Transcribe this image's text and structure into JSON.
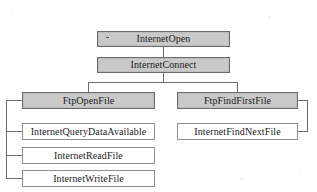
{
  "diagram": {
    "type": "flowchart",
    "colors": {
      "shaded_fill": "#c9c9c9",
      "shaded_border": "#6b6b6b",
      "plain_fill": "#ffffff",
      "plain_border": "#8f8f8f",
      "connector": "#6d6d6d",
      "text": "#1b1b1b",
      "background": "#ffffff"
    },
    "nodes": [
      {
        "id": "internet-open",
        "label": "InternetOpen",
        "style": "shaded",
        "marker": "·",
        "x": 97,
        "y": 31,
        "w": 133,
        "h": 16
      },
      {
        "id": "internet-connect",
        "label": "InternetConnect",
        "style": "shaded",
        "x": 97,
        "y": 57,
        "w": 133,
        "h": 16
      },
      {
        "id": "ftp-open-file",
        "label": "FtpOpenFile",
        "style": "shaded",
        "x": 22,
        "y": 92,
        "w": 133,
        "h": 17
      },
      {
        "id": "ftp-find-first-file",
        "label": "FtpFindFirstFile",
        "style": "shaded",
        "x": 177,
        "y": 92,
        "w": 121,
        "h": 17
      },
      {
        "id": "internet-query-data-available",
        "label": "InternetQueryDataAvailable",
        "style": "plain",
        "x": 22,
        "y": 123,
        "w": 133,
        "h": 17
      },
      {
        "id": "internet-find-next-file",
        "label": "InternetFindNextFile",
        "style": "plain",
        "x": 177,
        "y": 123,
        "w": 121,
        "h": 17
      },
      {
        "id": "internet-read-file",
        "label": "InternetReadFile",
        "style": "plain",
        "x": 22,
        "y": 147,
        "w": 133,
        "h": 17
      },
      {
        "id": "internet-write-file",
        "label": "InternetWriteFile",
        "style": "plain",
        "x": 22,
        "y": 170,
        "w": 133,
        "h": 17
      }
    ],
    "connectors": [
      {
        "id": "open-to-connect",
        "from": "internet-open",
        "to": "internet-connect"
      },
      {
        "id": "connect-split",
        "from": "internet-connect",
        "to": "ftp-open-file"
      },
      {
        "id": "connect-split-right",
        "from": "internet-connect",
        "to": "ftp-find-first-file"
      },
      {
        "id": "left-bracket",
        "from": "ftp-open-file",
        "to": "internet-write-file"
      },
      {
        "id": "right-bracket",
        "from": "ftp-find-first-file",
        "to": "internet-find-next-file"
      }
    ]
  }
}
